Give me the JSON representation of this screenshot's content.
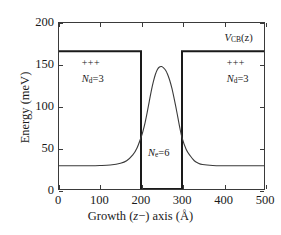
{
  "chart_data": {
    "type": "line",
    "title": "",
    "xlabel": "Growth (z−) axis (Å)",
    "ylabel": "Energy (meV)",
    "xlim": [
      0,
      500
    ],
    "ylim": [
      0,
      200
    ],
    "xticks": [
      0,
      100,
      200,
      300,
      400,
      500
    ],
    "yticks": [
      0,
      50,
      100,
      150,
      200
    ],
    "grid": false,
    "legend": null,
    "series": [
      {
        "name": "V_CB(z)",
        "type": "step",
        "description": "Conduction band edge square-well potential",
        "barrier_height_meV": 166,
        "well_bottom_meV": 0,
        "well_start_angstrom": 200,
        "well_end_angstrom": 300,
        "x": [
          0,
          200,
          200,
          300,
          300,
          500
        ],
        "y": [
          166,
          166,
          0,
          0,
          166,
          166
        ],
        "color": "#1a1a1a",
        "linewidth": 2.0
      },
      {
        "name": "self-consistent potential",
        "type": "line",
        "description": "Smooth Hartree/self-consistent potential peaking inside the well",
        "baseline_meV": 28,
        "peak_meV": 147,
        "peak_position_angstrom": 250,
        "x": [
          0,
          25,
          50,
          75,
          100,
          125,
          150,
          165,
          180,
          190,
          200,
          205,
          210,
          215,
          220,
          225,
          230,
          235,
          240,
          245,
          250,
          255,
          260,
          265,
          270,
          275,
          280,
          285,
          290,
          295,
          300,
          310,
          320,
          330,
          340,
          350,
          375,
          400,
          425,
          450,
          475,
          500
        ],
        "y": [
          28,
          28,
          28,
          28,
          28.3,
          29,
          31,
          34,
          41,
          49,
          62,
          70,
          80,
          92,
          105,
          118,
          129,
          138,
          144,
          147,
          147.5,
          146,
          143,
          138,
          131,
          122,
          111,
          99,
          86,
          73,
          62,
          48,
          40,
          34,
          31,
          29.5,
          28.3,
          28,
          28,
          28,
          28,
          28
        ],
        "color": "#3a3a3a",
        "linewidth": 1.1
      }
    ],
    "annotations": [
      {
        "id": "vcb",
        "text": "V_CB(z)",
        "x_angstrom": 400,
        "y_meV": 182
      },
      {
        "id": "plus-left",
        "text": "+++",
        "x_angstrom": 55,
        "y_meV": 152
      },
      {
        "id": "nd-left",
        "text": "N_d=3",
        "x_angstrom": 55,
        "y_meV": 133
      },
      {
        "id": "plus-right",
        "text": "+++",
        "x_angstrom": 405,
        "y_meV": 152
      },
      {
        "id": "nd-right",
        "text": "N_d=3",
        "x_angstrom": 405,
        "y_meV": 133
      },
      {
        "id": "ne-well",
        "text": "N_e=6",
        "x_angstrom": 215,
        "y_meV": 45
      }
    ]
  },
  "axes": {
    "x_title": "Growth (z−) axis (Å)",
    "y_title": "Energy (meV)",
    "x_tick_labels": [
      "0",
      "100",
      "200",
      "300",
      "400",
      "500"
    ],
    "y_tick_labels": [
      "0",
      "50",
      "100",
      "150",
      "200"
    ]
  },
  "labels": {
    "vcb_symbol": "V",
    "vcb_sub": "CB",
    "vcb_arg": "(z)",
    "plus_signs": "+++",
    "nd_symbol": "N",
    "nd_sub": "d",
    "nd_value": "=3",
    "ne_symbol": "N",
    "ne_sub": "e",
    "ne_value": "=6",
    "growth_word": "Growth (",
    "growth_z": "z",
    "growth_tail": "−) axis (Å)",
    "energy_title": "Energy (meV)"
  },
  "colors": {
    "background": "#ffffff",
    "frame": "#3a3a3a",
    "potential_line": "#1a1a1a",
    "curve_line": "#3a3a3a",
    "text": "#1a1a1a"
  }
}
